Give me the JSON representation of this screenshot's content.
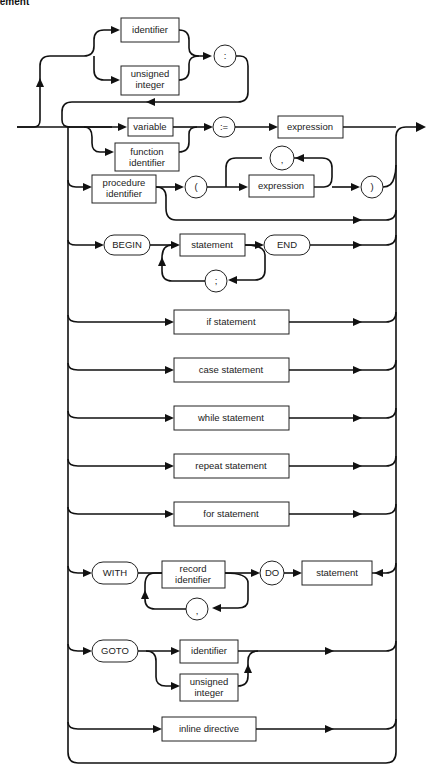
{
  "diagram": {
    "title": "statement",
    "title_visible": "ement",
    "label": {
      "identifier": "identifier",
      "unsigned_integer_1": "unsigned",
      "unsigned_integer_2": "integer",
      "colon": ":",
      "variable": "variable",
      "function_identifier_1": "function",
      "function_identifier_2": "identifier",
      "assign": ":=",
      "expression": "expression",
      "procedure_identifier_1": "procedure",
      "procedure_identifier_2": "identifier",
      "lparen": "(",
      "comma": ",",
      "rparen": ")",
      "begin": "BEGIN",
      "statement": "statement",
      "semicolon": ";",
      "end": "END",
      "if_statement": "if statement",
      "case_statement": "case statement",
      "while_statement": "while statement",
      "repeat_statement": "repeat statement",
      "for_statement": "for statement",
      "with": "WITH",
      "record_identifier_1": "record",
      "record_identifier_2": "identifier",
      "do": "DO",
      "goto": "GOTO",
      "inline_directive": "inline directive"
    },
    "node_shapes": {
      "rectangle": "non-terminal",
      "rounded": "terminal symbol"
    }
  }
}
